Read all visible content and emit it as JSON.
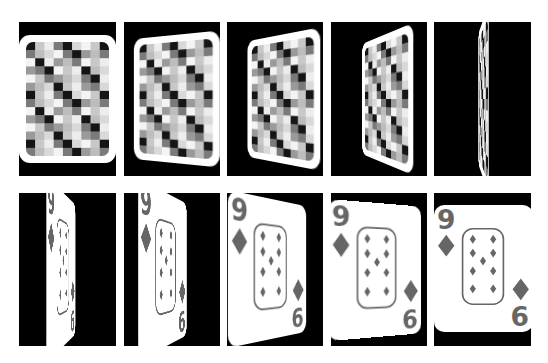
{
  "figure": {
    "background_color": "#ffffff",
    "frame_background": "#000000",
    "card_color": "#ffffff",
    "ink_color": "#666666"
  },
  "card_face": {
    "rank_top": "9",
    "rank_bottom": "6",
    "suit": "diamond",
    "pip_count": 9
  },
  "frames": [
    {
      "index": 1,
      "side": "back",
      "rotate_y": 0
    },
    {
      "index": 2,
      "side": "back",
      "rotate_y": -25
    },
    {
      "index": 3,
      "side": "back",
      "rotate_y": -45
    },
    {
      "index": 4,
      "side": "back",
      "rotate_y": -65
    },
    {
      "index": 5,
      "side": "back",
      "rotate_y": -88
    },
    {
      "index": 6,
      "side": "front",
      "rotate_y": 78
    },
    {
      "index": 7,
      "side": "front",
      "rotate_y": 62
    },
    {
      "index": 8,
      "side": "front",
      "rotate_y": 40
    },
    {
      "index": 9,
      "side": "front",
      "rotate_y": 18
    },
    {
      "index": 10,
      "side": "front",
      "rotate_y": 0
    }
  ]
}
